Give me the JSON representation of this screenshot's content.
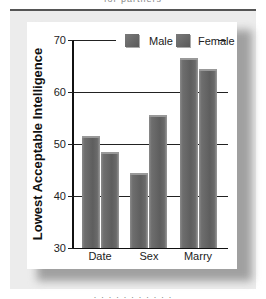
{
  "captions": {
    "top_cut": "for partners",
    "bottom_cut": "· · · · · · · · · · ·"
  },
  "chart_data": {
    "type": "bar",
    "title": "",
    "xlabel": "",
    "ylabel": "Lowest Acceptable Intelligence",
    "categories": [
      "Date",
      "Sex",
      "Marry"
    ],
    "series": [
      {
        "name": "Male",
        "values": [
          51.5,
          44.5,
          66.5
        ],
        "color": "#676767"
      },
      {
        "name": "Female",
        "values": [
          48.5,
          55.5,
          64.5
        ],
        "color": "#626262"
      }
    ],
    "ylim": [
      30,
      70
    ],
    "yticks": [
      30,
      40,
      50,
      60,
      70
    ],
    "grid": true,
    "legend_position": "top-right inside"
  }
}
